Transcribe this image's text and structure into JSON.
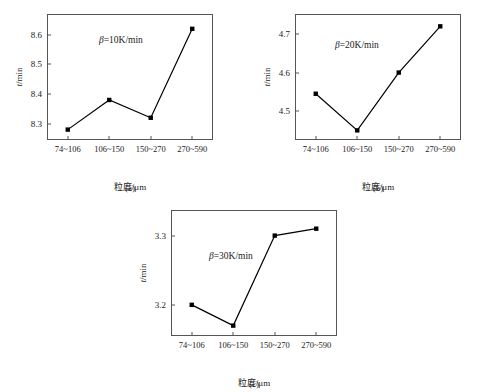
{
  "figure": {
    "shared": {
      "x_axis_title": "粒度/μm",
      "y_axis_title_symbol": "t",
      "y_axis_title_unit": "/min",
      "categories": [
        "74~106",
        "106~150",
        "150~270",
        "270~590"
      ]
    }
  },
  "chart_data": [
    {
      "type": "line",
      "panel": "a",
      "caption": "(a)",
      "annotation": "=10K/min",
      "annotation_symbol": "β",
      "title": "",
      "xlabel": "粒度/μm",
      "ylabel": "t/min",
      "categories": [
        "74~106",
        "106~150",
        "150~270",
        "270~590"
      ],
      "values": [
        8.28,
        8.38,
        8.32,
        8.62
      ],
      "yticks": [
        8.3,
        8.4,
        8.5,
        8.6
      ],
      "ytick_labels": [
        "8.3",
        "8.4",
        "8.5",
        "8.6"
      ],
      "ylim": [
        8.245,
        8.67
      ],
      "grid": false,
      "marker": "filled-square",
      "line_color": "#000000"
    },
    {
      "type": "line",
      "panel": "b",
      "caption": "(b)",
      "annotation": "=20K/min",
      "annotation_symbol": "β",
      "title": "",
      "xlabel": "粒度/μm",
      "ylabel": "t/min",
      "categories": [
        "74~106",
        "106~150",
        "150~270",
        "270~590"
      ],
      "values": [
        4.545,
        4.45,
        4.6,
        4.72
      ],
      "yticks": [
        4.5,
        4.6,
        4.7
      ],
      "ytick_labels": [
        "4.5",
        "4.6",
        "4.7"
      ],
      "ylim": [
        4.425,
        4.752
      ],
      "grid": false,
      "marker": "filled-square",
      "line_color": "#000000"
    },
    {
      "type": "line",
      "panel": "c",
      "caption": "(c)",
      "annotation": "=30K/min",
      "annotation_symbol": "β",
      "title": "",
      "xlabel": "粒度/μm",
      "ylabel": "t/min",
      "categories": [
        "74~106",
        "106~150",
        "150~270",
        "270~590"
      ],
      "values": [
        3.2,
        3.17,
        3.3,
        3.31
      ],
      "yticks": [
        3.2,
        3.3
      ],
      "ytick_labels": [
        "3.2",
        "3.3"
      ],
      "ylim": [
        3.155,
        3.337
      ],
      "grid": false,
      "marker": "filled-square",
      "line_color": "#000000"
    }
  ]
}
